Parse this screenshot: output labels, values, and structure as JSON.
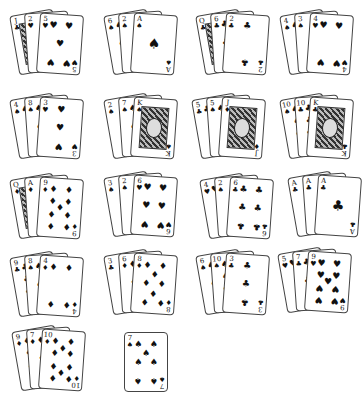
{
  "table": {
    "background": "#ffffff",
    "hands": [
      {
        "id": "hand-1",
        "x": 14,
        "y": 12,
        "cards": [
          {
            "rank": "J",
            "suit": "♣",
            "face": true
          },
          {
            "rank": "2",
            "suit": "♥"
          },
          {
            "rank": "5",
            "suit": "♥"
          }
        ]
      },
      {
        "id": "hand-2",
        "x": 108,
        "y": 12,
        "cards": [
          {
            "rank": "6",
            "suit": "♠"
          },
          {
            "rank": "2",
            "suit": "♠"
          },
          {
            "rank": "A",
            "suit": "♠"
          }
        ]
      },
      {
        "id": "hand-3",
        "x": 200,
        "y": 12,
        "cards": [
          {
            "rank": "Q",
            "suit": "♣",
            "face": true
          },
          {
            "rank": "6",
            "suit": "♣"
          },
          {
            "rank": "2",
            "suit": "♣"
          }
        ]
      },
      {
        "id": "hand-4",
        "x": 284,
        "y": 12,
        "cards": [
          {
            "rank": "4",
            "suit": "♠"
          },
          {
            "rank": "3",
            "suit": "♠"
          },
          {
            "rank": "4",
            "suit": "♥"
          }
        ]
      },
      {
        "id": "hand-5",
        "x": 14,
        "y": 96,
        "cards": [
          {
            "rank": "4",
            "suit": "♠"
          },
          {
            "rank": "8",
            "suit": "♠"
          },
          {
            "rank": "3",
            "suit": "♥"
          }
        ]
      },
      {
        "id": "hand-6",
        "x": 108,
        "y": 96,
        "cards": [
          {
            "rank": "2",
            "suit": "♠"
          },
          {
            "rank": "7",
            "suit": "♠"
          },
          {
            "rank": "K",
            "suit": "♠",
            "face": true
          }
        ]
      },
      {
        "id": "hand-7",
        "x": 196,
        "y": 96,
        "cards": [
          {
            "rank": "5",
            "suit": "♣"
          },
          {
            "rank": "5",
            "suit": "♠"
          },
          {
            "rank": "J",
            "suit": "♦",
            "face": true
          }
        ]
      },
      {
        "id": "hand-8",
        "x": 284,
        "y": 96,
        "cards": [
          {
            "rank": "10",
            "suit": "♠"
          },
          {
            "rank": "10",
            "suit": "♣"
          },
          {
            "rank": "K",
            "suit": "♣",
            "face": true
          }
        ]
      },
      {
        "id": "hand-9",
        "x": 14,
        "y": 176,
        "cards": [
          {
            "rank": "Q",
            "suit": "♦",
            "face": true
          },
          {
            "rank": "A",
            "suit": "♦"
          },
          {
            "rank": "9",
            "suit": "♦"
          }
        ]
      },
      {
        "id": "hand-10",
        "x": 108,
        "y": 174,
        "cards": [
          {
            "rank": "3",
            "suit": "♠"
          },
          {
            "rank": "2",
            "suit": "♠"
          },
          {
            "rank": "6",
            "suit": "♥"
          }
        ]
      },
      {
        "id": "hand-11",
        "x": 204,
        "y": 176,
        "cards": [
          {
            "rank": "4",
            "suit": "♥"
          },
          {
            "rank": "2",
            "suit": "♠"
          },
          {
            "rank": "6",
            "suit": "♣"
          }
        ]
      },
      {
        "id": "hand-12",
        "x": 292,
        "y": 174,
        "cards": [
          {
            "rank": "A",
            "suit": "♣"
          },
          {
            "rank": "A",
            "suit": "♣"
          },
          {
            "rank": "A",
            "suit": "♣"
          }
        ]
      },
      {
        "id": "hand-13",
        "x": 14,
        "y": 254,
        "cards": [
          {
            "rank": "9",
            "suit": "♣"
          },
          {
            "rank": "8",
            "suit": "♠"
          },
          {
            "rank": "4",
            "suit": "♦"
          }
        ]
      },
      {
        "id": "hand-14",
        "x": 108,
        "y": 252,
        "cards": [
          {
            "rank": "3",
            "suit": "♣"
          },
          {
            "rank": "6",
            "suit": "♦"
          },
          {
            "rank": "8",
            "suit": "♦"
          }
        ]
      },
      {
        "id": "hand-15",
        "x": 200,
        "y": 252,
        "cards": [
          {
            "rank": "6",
            "suit": "♠"
          },
          {
            "rank": "10",
            "suit": "♠"
          },
          {
            "rank": "3",
            "suit": "♣"
          }
        ]
      },
      {
        "id": "hand-16",
        "x": 282,
        "y": 250,
        "cards": [
          {
            "rank": "5",
            "suit": "♥"
          },
          {
            "rank": "7",
            "suit": "♣"
          },
          {
            "rank": "9",
            "suit": "♥"
          }
        ]
      },
      {
        "id": "hand-17",
        "x": 16,
        "y": 328,
        "cards": [
          {
            "rank": "9",
            "suit": "♦"
          },
          {
            "rank": "7",
            "suit": "♦"
          },
          {
            "rank": "10",
            "suit": "♦"
          }
        ]
      },
      {
        "id": "hand-18",
        "x": 124,
        "y": 332,
        "cards": [
          {
            "rank": "7",
            "suit": "♠"
          }
        ]
      }
    ]
  }
}
